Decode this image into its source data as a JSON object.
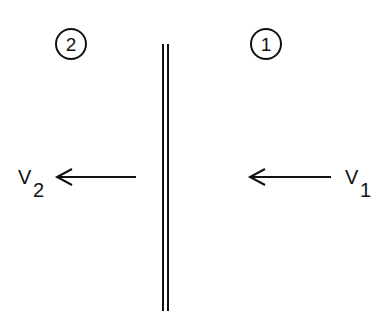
{
  "diagram": {
    "regions": [
      {
        "id": "region-2",
        "label": "2",
        "side": "left"
      },
      {
        "id": "region-1",
        "label": "1",
        "side": "right"
      }
    ],
    "barrier": {
      "type": "double-line",
      "description": "thin wall / interface"
    },
    "velocities": [
      {
        "id": "v1",
        "symbol": "V",
        "subscript": "1",
        "direction": "left",
        "side": "right"
      },
      {
        "id": "v2",
        "symbol": "V",
        "subscript": "2",
        "direction": "left",
        "side": "left"
      }
    ],
    "colors": {
      "stroke": "#111111",
      "background": "#ffffff"
    }
  }
}
